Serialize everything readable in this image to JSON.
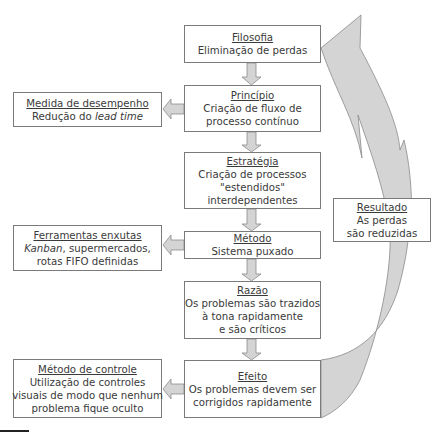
{
  "diagram": {
    "main_column": [
      {
        "id": "filosofia",
        "title": "Filosofia",
        "lines": [
          "Eliminação de perdas"
        ]
      },
      {
        "id": "principio",
        "title": "Princípio",
        "lines": [
          "Criação de fluxo de",
          "processo contínuo"
        ]
      },
      {
        "id": "estrategia",
        "title": "Estratégia",
        "lines": [
          "Criação de processos",
          "\"estendidos\"",
          "interdependentes"
        ]
      },
      {
        "id": "metodo",
        "title": "Método",
        "lines": [
          "Sistema puxado"
        ]
      },
      {
        "id": "razao",
        "title": "Razão",
        "lines": [
          "Os problemas são trazidos",
          "à tona rapidamente",
          "e são críticos"
        ]
      },
      {
        "id": "efeito",
        "title": "Efeito",
        "lines": [
          "Os problemas devem ser",
          "corrigidos rapidamente"
        ]
      }
    ],
    "side_boxes": [
      {
        "id": "medida",
        "from": "principio",
        "title": "Medida de desempenho",
        "line1_plain": "Redução do ",
        "line1_italic": "lead time"
      },
      {
        "id": "ferramentas",
        "from": "metodo",
        "title": "Ferramentas enxutas",
        "line1_italic": "Kanban",
        "line1_plain": ", supermercados,",
        "line2": "rotas FIFO definidas"
      },
      {
        "id": "controle",
        "from": "efeito",
        "title": "Método de controle",
        "lines": [
          "Utilização de controles",
          "visuais de modo que nenhum",
          "problema fique oculto"
        ]
      }
    ],
    "feedback": {
      "title": "Resultado",
      "lines": [
        "As perdas",
        "são reduzidas"
      ],
      "from": "efeito",
      "to": "filosofia"
    },
    "colors": {
      "border": "#7a7a7a",
      "arrow_fill": "#d4d4d4",
      "arrow_stroke": "#8a8a8a",
      "text": "#3a3a3a"
    }
  }
}
